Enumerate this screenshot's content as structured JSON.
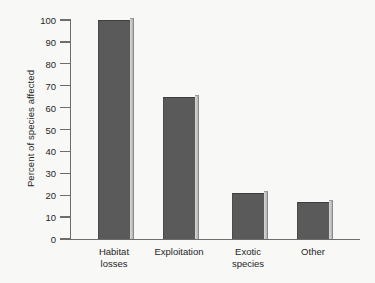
{
  "chart_data": {
    "type": "bar",
    "title": "",
    "xlabel": "",
    "ylabel": "Percent of species affected",
    "categories": [
      "Habitat\nlosses",
      "Exploitation",
      "Exotic\nspecies",
      "Other"
    ],
    "values": [
      100,
      65,
      21,
      17
    ],
    "ylim": [
      0,
      100
    ],
    "ytick_labels": [
      "100",
      "90",
      "80",
      "70",
      "60",
      "50",
      "40",
      "30",
      "20",
      "10",
      "0"
    ],
    "ytick_values": [
      100,
      90,
      80,
      70,
      60,
      50,
      40,
      30,
      20,
      10,
      0
    ],
    "grid": false,
    "legend": false,
    "bar_color": "#5a5a5a",
    "bar_edge_highlight_color": "#d9d9d9",
    "axis_color": "#6d6d6d",
    "background_color": "#f8f8f6",
    "text_color": "#1f1f1f"
  }
}
